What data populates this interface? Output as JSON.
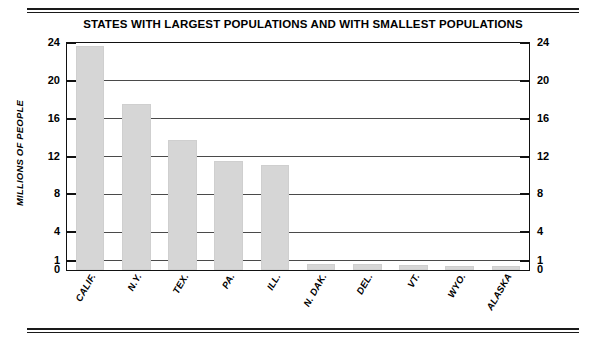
{
  "figure": {
    "title": "STATES WITH LARGEST POPULATIONS AND WITH SMALLEST POPULATIONS",
    "bar_color": "#d6d6d6",
    "axis_color": "#111111",
    "gridline_color": "#4a4a4a",
    "background": "#ffffff"
  },
  "chart_data": {
    "type": "bar",
    "title": "STATES WITH LARGEST POPULATIONS AND WITH SMALLEST POPULATIONS",
    "xlabel": "",
    "ylabel": "MILLIONS OF PEOPLE",
    "ylim": [
      0,
      24
    ],
    "grid": true,
    "legend": "none",
    "categories": [
      "CALIF.",
      "N.Y.",
      "TEX.",
      "PA.",
      "ILL.",
      "N. DAK.",
      "DEL.",
      "VT.",
      "WYO.",
      "ALASKA"
    ],
    "values": [
      23.7,
      17.5,
      13.7,
      11.5,
      11.1,
      0.65,
      0.6,
      0.5,
      0.47,
      0.4
    ],
    "yticks": [
      0,
      1,
      4,
      8,
      12,
      16,
      20,
      24
    ],
    "ytick_labels": [
      "0",
      "1",
      "4",
      "8",
      "12",
      "16",
      "20",
      "24"
    ],
    "right_axis_ytick_labels": [
      "0",
      "1",
      "4",
      "8",
      "12",
      "16",
      "20",
      "24"
    ]
  }
}
